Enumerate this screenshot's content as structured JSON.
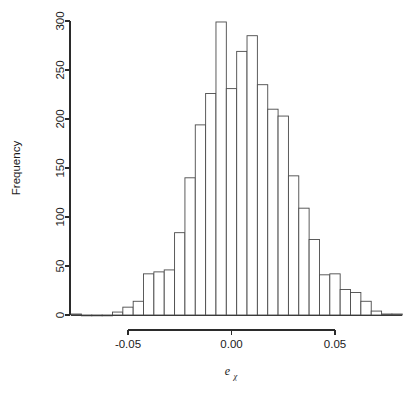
{
  "chart_data": {
    "type": "bar",
    "title": "",
    "subtitle": "",
    "xlabel": "e",
    "xlabel_subscript": "χ",
    "ylabel": "Frequency",
    "xlim": [
      -0.0775,
      0.0825
    ],
    "ylim": [
      0,
      300
    ],
    "grid": false,
    "legend": null,
    "bin_width": 0.005,
    "xticks": [
      -0.05,
      0.0,
      0.05
    ],
    "xtick_labels": [
      "-0.05",
      "0.00",
      "0.05"
    ],
    "yticks": [
      0,
      50,
      100,
      150,
      200,
      250,
      300
    ],
    "ytick_labels": [
      "0",
      "50",
      "100",
      "150",
      "200",
      "250",
      "300"
    ],
    "bin_starts": [
      -0.0775,
      -0.0725,
      -0.0675,
      -0.0625,
      -0.0575,
      -0.0525,
      -0.0475,
      -0.0425,
      -0.0375,
      -0.0325,
      -0.0275,
      -0.0225,
      -0.0175,
      -0.0125,
      -0.0075,
      -0.0025,
      0.0025,
      0.0075,
      0.0125,
      0.0175,
      0.0225,
      0.0275,
      0.0325,
      0.0375,
      0.0425,
      0.0475,
      0.0525,
      0.0575,
      0.0625,
      0.0675,
      0.0725,
      0.0775
    ],
    "categories": [
      "-0.0775",
      "-0.0725",
      "-0.0675",
      "-0.0625",
      "-0.0575",
      "-0.0525",
      "-0.0475",
      "-0.0425",
      "-0.0375",
      "-0.0325",
      "-0.0275",
      "-0.0225",
      "-0.0175",
      "-0.0125",
      "-0.0075",
      "-0.0025",
      "0.0025",
      "0.0075",
      "0.0125",
      "0.0175",
      "0.0225",
      "0.0275",
      "0.0325",
      "0.0375",
      "0.0425",
      "0.0475",
      "0.0525",
      "0.0575",
      "0.0625",
      "0.0675",
      "0.0725",
      "0.0775"
    ],
    "values": [
      1,
      0,
      0,
      0,
      3,
      8,
      14,
      42,
      44,
      46,
      84,
      140,
      194,
      226,
      299,
      231,
      269,
      285,
      235,
      210,
      203,
      142,
      109,
      77,
      41,
      42,
      26,
      23,
      14,
      4,
      1,
      1
    ]
  },
  "axis": {
    "y_title": "Frequency"
  }
}
